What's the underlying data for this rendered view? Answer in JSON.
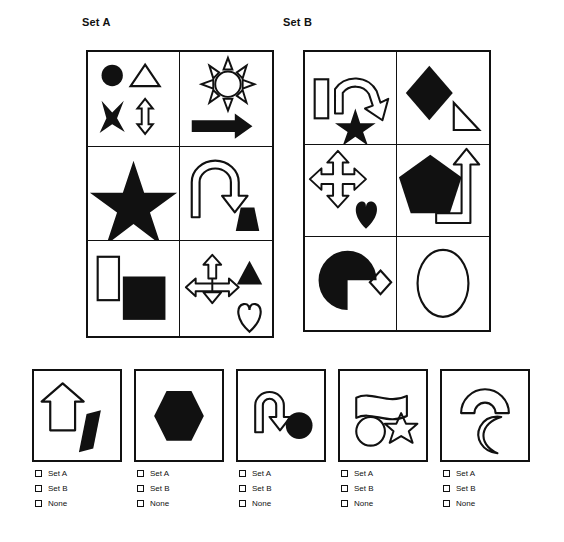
{
  "page": {
    "ink_color": "#111111",
    "background_color": "#ffffff"
  },
  "sets": [
    {
      "id": "set-a",
      "label": "Set A",
      "cells": [
        {
          "name": "cell-a1",
          "shapes": [
            "filled-circle",
            "outline-triangle",
            "filled-four-point-star",
            "outline-double-arrow-vertical"
          ]
        },
        {
          "name": "cell-a2",
          "shapes": [
            "outline-sun",
            "filled-right-arrow"
          ]
        },
        {
          "name": "cell-a3",
          "shapes": [
            "filled-five-point-star"
          ]
        },
        {
          "name": "cell-a4",
          "shapes": [
            "outline-u-turn-arrow",
            "filled-trapezoid"
          ]
        },
        {
          "name": "cell-a5",
          "shapes": [
            "outline-rectangle",
            "filled-square"
          ]
        },
        {
          "name": "cell-a6",
          "shapes": [
            "outline-four-way-arrow",
            "filled-triangle",
            "outline-heart"
          ]
        }
      ]
    },
    {
      "id": "set-b",
      "label": "Set B",
      "cells": [
        {
          "name": "cell-b1",
          "shapes": [
            "outline-rectangle",
            "outline-curved-arrow",
            "filled-five-point-star"
          ]
        },
        {
          "name": "cell-b2",
          "shapes": [
            "filled-diamond",
            "outline-right-triangle"
          ]
        },
        {
          "name": "cell-b3",
          "shapes": [
            "outline-four-way-arrow",
            "filled-heart"
          ]
        },
        {
          "name": "cell-b4",
          "shapes": [
            "filled-pentagon",
            "outline-bent-arrow"
          ]
        },
        {
          "name": "cell-b5",
          "shapes": [
            "filled-half-circle",
            "outline-small-diamond"
          ]
        },
        {
          "name": "cell-b6",
          "shapes": [
            "outline-ellipse"
          ]
        }
      ]
    }
  ],
  "options": [
    {
      "id": "option-1",
      "shapes": [
        "outline-up-arrow",
        "filled-slanted-rectangle"
      ],
      "choices": [
        {
          "id": "option-1-set-a",
          "label": "Set A",
          "checked": false
        },
        {
          "id": "option-1-set-b",
          "label": "Set B",
          "checked": false
        },
        {
          "id": "option-1-none",
          "label": "None",
          "checked": false
        }
      ]
    },
    {
      "id": "option-2",
      "shapes": [
        "filled-hexagon"
      ],
      "choices": [
        {
          "id": "option-2-set-a",
          "label": "Set A",
          "checked": false
        },
        {
          "id": "option-2-set-b",
          "label": "Set B",
          "checked": false
        },
        {
          "id": "option-2-none",
          "label": "None",
          "checked": false
        }
      ]
    },
    {
      "id": "option-3",
      "shapes": [
        "outline-u-turn-arrow",
        "filled-circle"
      ],
      "choices": [
        {
          "id": "option-3-set-a",
          "label": "Set A",
          "checked": false
        },
        {
          "id": "option-3-set-b",
          "label": "Set B",
          "checked": false
        },
        {
          "id": "option-3-none",
          "label": "None",
          "checked": false
        }
      ]
    },
    {
      "id": "option-4",
      "shapes": [
        "outline-flag",
        "outline-circle",
        "outline-six-point-star"
      ],
      "choices": [
        {
          "id": "option-4-set-a",
          "label": "Set A",
          "checked": false
        },
        {
          "id": "option-4-set-b",
          "label": "Set B",
          "checked": false
        },
        {
          "id": "option-4-none",
          "label": "None",
          "checked": false
        }
      ]
    },
    {
      "id": "option-5",
      "shapes": [
        "outline-arch",
        "outline-crescent"
      ],
      "choices": [
        {
          "id": "option-5-set-a",
          "label": "Set A",
          "checked": false
        },
        {
          "id": "option-5-set-b",
          "label": "Set B",
          "checked": false
        },
        {
          "id": "option-5-none",
          "label": "None",
          "checked": false
        }
      ]
    }
  ]
}
